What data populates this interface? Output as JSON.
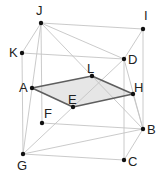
{
  "diagram": {
    "type": "geometry-3d-cube",
    "points": [
      {
        "name": "J",
        "label": "J",
        "x": 41,
        "y": 23,
        "lx": 36,
        "ly": 15
      },
      {
        "name": "I",
        "label": "I",
        "x": 143,
        "y": 29,
        "lx": 144,
        "ly": 20
      },
      {
        "name": "K",
        "label": "K",
        "x": 22,
        "y": 53,
        "lx": 9,
        "ly": 57
      },
      {
        "name": "D",
        "label": "D",
        "x": 124,
        "y": 59,
        "lx": 128,
        "ly": 64
      },
      {
        "name": "L",
        "label": "L",
        "x": 92,
        "y": 76,
        "lx": 87,
        "ly": 73
      },
      {
        "name": "A",
        "label": "A",
        "x": 32,
        "y": 88,
        "lx": 19,
        "ly": 92
      },
      {
        "name": "H",
        "label": "H",
        "x": 133,
        "y": 94,
        "lx": 134,
        "ly": 92
      },
      {
        "name": "E",
        "label": "E",
        "x": 73,
        "y": 107,
        "lx": 68,
        "ly": 104
      },
      {
        "name": "F",
        "label": "F",
        "x": 42,
        "y": 123,
        "lx": 44,
        "ly": 118
      },
      {
        "name": "B",
        "label": "B",
        "x": 143,
        "y": 129,
        "lx": 147,
        "ly": 134
      },
      {
        "name": "G",
        "label": "G",
        "x": 23,
        "y": 154,
        "lx": 17,
        "ly": 170
      },
      {
        "name": "C",
        "label": "C",
        "x": 124,
        "y": 160,
        "lx": 128,
        "ly": 166
      }
    ],
    "edges_light": [
      [
        "J",
        "I"
      ],
      [
        "J",
        "K"
      ],
      [
        "J",
        "F"
      ],
      [
        "J",
        "G"
      ],
      [
        "J",
        "D"
      ],
      [
        "J",
        "B"
      ],
      [
        "K",
        "D"
      ],
      [
        "K",
        "G"
      ],
      [
        "I",
        "B"
      ],
      [
        "I",
        "D"
      ],
      [
        "D",
        "C"
      ],
      [
        "D",
        "B"
      ],
      [
        "D",
        "E"
      ],
      [
        "G",
        "E"
      ],
      [
        "F",
        "B"
      ],
      [
        "G",
        "B"
      ],
      [
        "G",
        "C"
      ],
      [
        "C",
        "B"
      ],
      [
        "H",
        "B"
      ]
    ],
    "edges_dark": [
      [
        "A",
        "L"
      ],
      [
        "L",
        "H"
      ],
      [
        "H",
        "E"
      ],
      [
        "E",
        "A"
      ]
    ],
    "shaded_face": [
      "A",
      "L",
      "H",
      "E"
    ],
    "colors": {
      "light_edge": "#c4c4c4",
      "dark_edge": "#5e5e5e",
      "face_fill": "#e6e6e6",
      "point": "#111111",
      "label": "#222222"
    }
  }
}
